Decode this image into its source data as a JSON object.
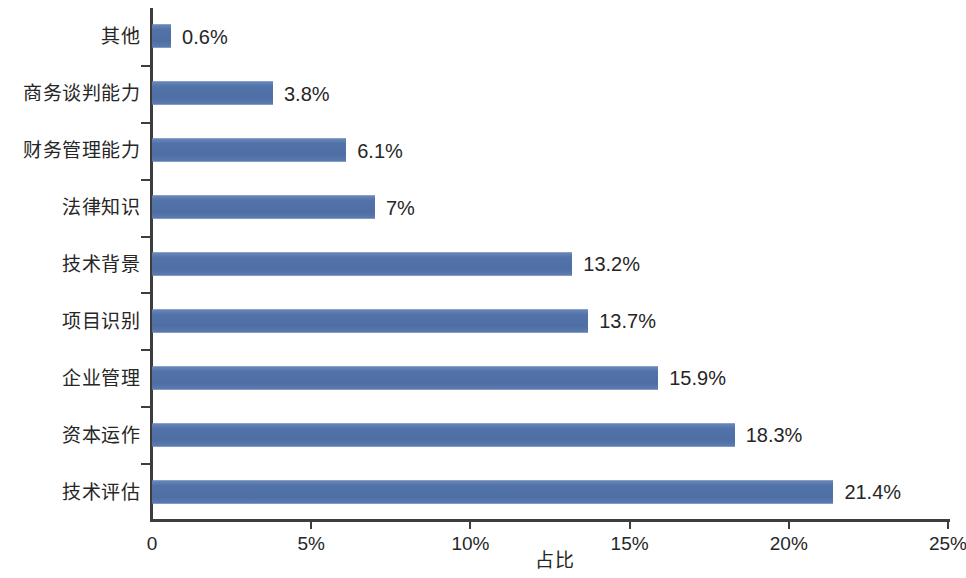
{
  "chart_data": {
    "type": "bar",
    "orientation": "horizontal",
    "title": "",
    "xlabel": "占比",
    "ylabel": "",
    "xlim": [
      0,
      25
    ],
    "xtick_labels": [
      "0",
      "5%",
      "10%",
      "15%",
      "20%",
      "25%"
    ],
    "xtick_values": [
      0,
      5,
      10,
      15,
      20,
      25
    ],
    "grid": false,
    "legend": false,
    "bar_color": "#5474ab",
    "axis_color": "#3d3d3d",
    "categories": [
      "其他",
      "商务谈判能力",
      "财务管理能力",
      "法律知识",
      "技术背景",
      "项目识别",
      "企业管理",
      "资本运作",
      "技术评估"
    ],
    "values": [
      0.6,
      3.8,
      6.1,
      7,
      13.2,
      13.7,
      15.9,
      18.3,
      21.4
    ],
    "value_labels": [
      "0.6%",
      "3.8%",
      "6.1%",
      "7%",
      "13.2%",
      "13.7%",
      "15.9%",
      "18.3%",
      "21.4%"
    ]
  }
}
